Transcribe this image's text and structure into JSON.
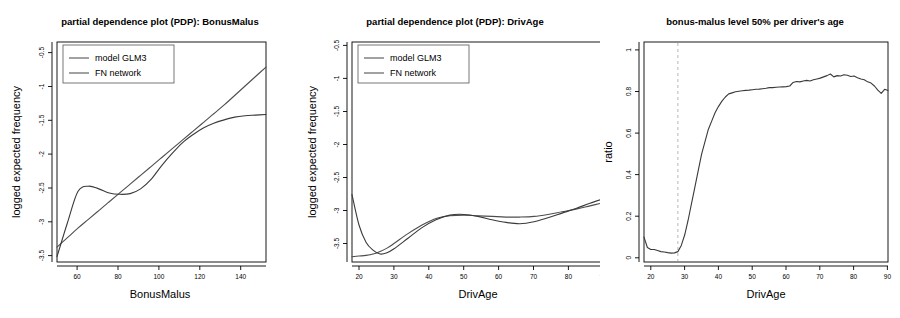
{
  "figure": {
    "background": "#ffffff",
    "width": 900,
    "height": 318,
    "panel_count": 3
  },
  "chart_data": [
    {
      "type": "line",
      "title": "partial dependence plot (PDP): BonusMalus",
      "xlabel": "BonusMalus",
      "ylabel": "logged expected frequency",
      "xlim": [
        50,
        150
      ],
      "ylim": [
        -3.7,
        -0.45
      ],
      "xticks": [
        60,
        80,
        100,
        120,
        140
      ],
      "yticks": [
        -3.5,
        -3.0,
        -2.5,
        -2.0,
        -1.5,
        -1.0,
        -0.5
      ],
      "grid": false,
      "legend_position": "top-left",
      "legend": [
        "model GLM3",
        "FN network"
      ],
      "x": [
        50,
        55,
        60,
        65,
        70,
        75,
        80,
        85,
        90,
        95,
        100,
        105,
        110,
        115,
        120,
        125,
        130,
        135,
        140,
        145,
        150
      ],
      "series": [
        {
          "name": "model GLM3",
          "color": "#4d4d4d",
          "values": [
            -3.48,
            -3.34,
            -3.2,
            -3.07,
            -2.94,
            -2.81,
            -2.68,
            -2.55,
            -2.42,
            -2.29,
            -2.16,
            -2.03,
            -1.9,
            -1.77,
            -1.64,
            -1.51,
            -1.38,
            -1.24,
            -1.1,
            -0.96,
            -0.82
          ]
        },
        {
          "name": "FN network",
          "color": "#3a3a3a",
          "values": [
            -3.62,
            -3.12,
            -2.66,
            -2.58,
            -2.62,
            -2.68,
            -2.7,
            -2.69,
            -2.62,
            -2.48,
            -2.28,
            -2.1,
            -1.94,
            -1.82,
            -1.72,
            -1.65,
            -1.6,
            -1.56,
            -1.54,
            -1.53,
            -1.52
          ]
        }
      ]
    },
    {
      "type": "line",
      "title": "partial dependence plot (PDP): DrivAge",
      "xlabel": "DrivAge",
      "ylabel": "logged expected frequency",
      "xlim": [
        18,
        90
      ],
      "ylim": [
        -3.78,
        -0.45
      ],
      "xticks": [
        20,
        30,
        40,
        50,
        60,
        70,
        80,
        90
      ],
      "yticks": [
        -3.5,
        -3.0,
        -2.5,
        -2.0,
        -1.5,
        -1.0,
        -0.5
      ],
      "grid": false,
      "legend_position": "top-left",
      "legend": [
        "model GLM3",
        "FN network"
      ],
      "x": [
        18,
        20,
        22,
        24,
        26,
        28,
        30,
        34,
        38,
        42,
        46,
        50,
        54,
        58,
        62,
        66,
        70,
        74,
        78,
        82,
        86,
        90
      ],
      "series": [
        {
          "name": "model GLM3",
          "color": "#4d4d4d",
          "values": [
            -3.7,
            -3.69,
            -3.68,
            -3.66,
            -3.62,
            -3.57,
            -3.5,
            -3.35,
            -3.22,
            -3.12,
            -3.08,
            -3.07,
            -3.08,
            -3.09,
            -3.1,
            -3.1,
            -3.09,
            -3.06,
            -3.02,
            -2.98,
            -2.93,
            -2.88
          ]
        },
        {
          "name": "FN network",
          "color": "#3a3a3a",
          "values": [
            -2.76,
            -3.22,
            -3.48,
            -3.6,
            -3.66,
            -3.64,
            -3.58,
            -3.42,
            -3.26,
            -3.14,
            -3.07,
            -3.06,
            -3.09,
            -3.14,
            -3.18,
            -3.2,
            -3.17,
            -3.11,
            -3.04,
            -2.97,
            -2.89,
            -2.82
          ]
        }
      ]
    },
    {
      "type": "line",
      "title": "bonus-malus level 50% per driver's age",
      "xlabel": "DrivAge",
      "ylabel": "ratio",
      "xlim": [
        18,
        90
      ],
      "ylim": [
        -0.02,
        1.04
      ],
      "xticks": [
        20,
        30,
        40,
        50,
        60,
        70,
        80,
        90
      ],
      "yticks": [
        0.0,
        0.2,
        0.4,
        0.6,
        0.8,
        1.0
      ],
      "grid": false,
      "legend_position": "none",
      "annotations": [
        {
          "type": "vline",
          "x": 28,
          "style": "dashed",
          "color": "#b0b0b0"
        }
      ],
      "series": [
        {
          "name": "ratio",
          "color": "#3a3a3a",
          "x": [
            18,
            19,
            20,
            21,
            22,
            23,
            24,
            25,
            26,
            27,
            28,
            29,
            30,
            31,
            32,
            33,
            34,
            35,
            36,
            37,
            38,
            39,
            40,
            41,
            42,
            43,
            44,
            45,
            46,
            47,
            48,
            49,
            50,
            51,
            52,
            53,
            54,
            55,
            56,
            57,
            58,
            59,
            60,
            61,
            62,
            63,
            64,
            65,
            66,
            67,
            68,
            69,
            70,
            71,
            72,
            73,
            74,
            75,
            76,
            77,
            78,
            79,
            80,
            81,
            82,
            83,
            84,
            85,
            86,
            87,
            88,
            89,
            90
          ],
          "values": [
            0.1,
            0.05,
            0.04,
            0.04,
            0.035,
            0.03,
            0.028,
            0.025,
            0.023,
            0.024,
            0.03,
            0.06,
            0.11,
            0.18,
            0.26,
            0.34,
            0.42,
            0.5,
            0.56,
            0.62,
            0.66,
            0.7,
            0.73,
            0.755,
            0.775,
            0.79,
            0.795,
            0.8,
            0.803,
            0.805,
            0.807,
            0.808,
            0.81,
            0.812,
            0.813,
            0.815,
            0.817,
            0.82,
            0.82,
            0.822,
            0.823,
            0.824,
            0.825,
            0.828,
            0.845,
            0.85,
            0.848,
            0.852,
            0.855,
            0.852,
            0.858,
            0.862,
            0.866,
            0.872,
            0.878,
            0.886,
            0.872,
            0.878,
            0.876,
            0.882,
            0.88,
            0.874,
            0.876,
            0.868,
            0.862,
            0.858,
            0.848,
            0.842,
            0.828,
            0.808,
            0.792,
            0.812,
            0.806
          ]
        }
      ]
    }
  ]
}
